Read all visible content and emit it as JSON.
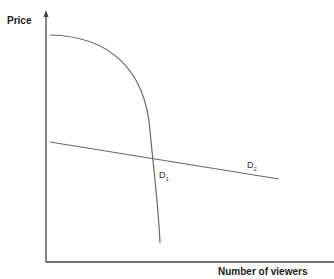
{
  "diagram": {
    "type": "demand curves",
    "y_axis_label": "Price",
    "x_axis_label": "Number of viewers",
    "curves": [
      {
        "name": "D1",
        "base": "D",
        "sub": "1",
        "shape": "concave, steeply falling"
      },
      {
        "name": "D2",
        "base": "D",
        "sub": "2",
        "shape": "straight, gently falling"
      }
    ],
    "colors": {
      "axes": "#444444",
      "curves": "#666666",
      "text": "#1a1a1a"
    }
  }
}
